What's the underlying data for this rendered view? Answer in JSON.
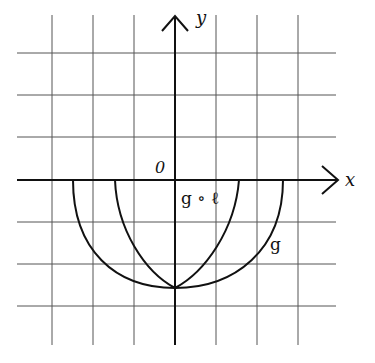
{
  "axes": {
    "x_label": "x",
    "y_label": "y",
    "origin_label": "0"
  },
  "grid": {
    "origin_px": [
      175,
      180
    ],
    "unit_px": 41.5,
    "x_range": [
      -3,
      3
    ],
    "y_range": [
      -3,
      3
    ]
  },
  "curves": [
    {
      "name": "g",
      "label": "g",
      "description": "lower half of circle-like curve",
      "x_extent": [
        -2.5,
        2.5
      ],
      "bottom_y": -2.6
    },
    {
      "name": "g∘ℓ",
      "label": "g ∘ ℓ",
      "description": "horizontally compressed version of g",
      "x_extent": [
        -1.5,
        1.5
      ],
      "bottom_y": -2.6
    }
  ],
  "colors": {
    "line": "#111111",
    "grid": "#555555",
    "background": "#ffffff"
  }
}
